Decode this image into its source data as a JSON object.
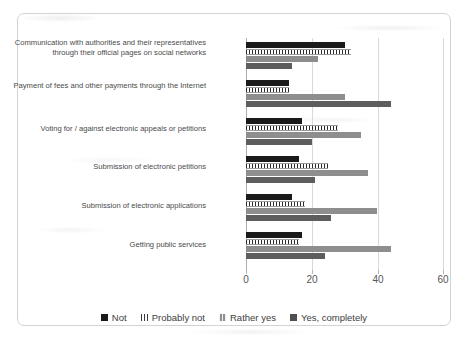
{
  "chart_data": {
    "type": "bar",
    "orientation": "horizontal",
    "title": "",
    "xlabel": "",
    "ylabel": "",
    "xlim": [
      0,
      60
    ],
    "xticks": [
      0,
      20,
      40,
      60
    ],
    "xtick_labels": [
      "0",
      "20",
      "40",
      "60"
    ],
    "grid": true,
    "legend_position": "bottom",
    "categories": [
      "Communication with authorities and their representatives through their official pages on social networks",
      "Payment of fees and other payments through the Internet",
      "Voting for / against electronic appeals or petitions",
      "Submission of electronic petitions",
      "Submission of electronic applications",
      "Getting public services"
    ],
    "series": [
      {
        "name": "Not",
        "values": [
          30,
          13,
          17,
          16,
          14,
          17
        ]
      },
      {
        "name": "Probably not",
        "values": [
          32,
          13,
          28,
          25,
          18,
          16
        ]
      },
      {
        "name": "Rather yes",
        "values": [
          22,
          30,
          35,
          37,
          40,
          44
        ]
      },
      {
        "name": "Yes, completely",
        "values": [
          14,
          44,
          20,
          21,
          26,
          24
        ]
      }
    ]
  },
  "legend": {
    "items": [
      {
        "label": "Not"
      },
      {
        "label": "Probably not"
      },
      {
        "label": "Rather yes"
      },
      {
        "label": "Yes, completely"
      }
    ]
  }
}
